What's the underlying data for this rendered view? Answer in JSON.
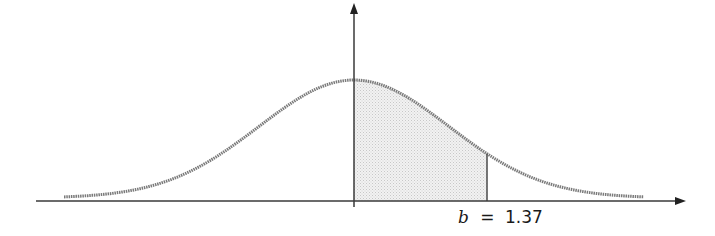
{
  "diagram": {
    "type": "normal-distribution",
    "label": {
      "variable": "b",
      "equals": "=",
      "value": "1.37"
    },
    "colors": {
      "axis": "#3a3a3a",
      "curve": "#7a7a7a",
      "shade": "#e6e6e6",
      "boundary_line": "#555555",
      "text": "#1a1a1a"
    },
    "layout": {
      "x_axis_y": 201,
      "x_axis_start": 36,
      "x_axis_end": 686,
      "y_axis_x": 354,
      "y_axis_top": 3,
      "y_axis_bottom": 207,
      "curve_start_x": 64,
      "curve_end_x": 644,
      "peak_y": 80,
      "baseline_y": 198,
      "sigma_px": 95,
      "b_x": 487
    }
  }
}
